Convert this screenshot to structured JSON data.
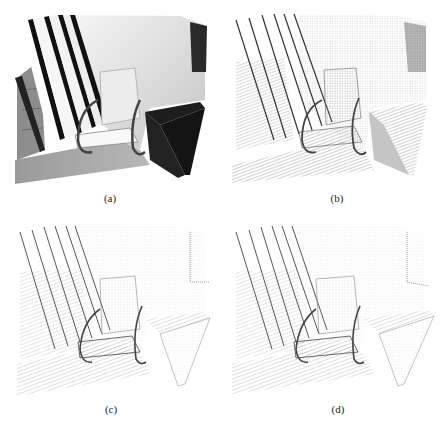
{
  "figure": {
    "panels": [
      {
        "id": "a",
        "caption": "(a)",
        "style": "solid-render"
      },
      {
        "id": "b",
        "caption": "(b)",
        "style": "dense-point-cloud"
      },
      {
        "id": "c",
        "caption": "(c)",
        "style": "sparse-point-cloud"
      },
      {
        "id": "d",
        "caption": "(d)",
        "style": "sparse-point-cloud"
      }
    ],
    "scene": "Indoor point-cloud reconstruction of a room corner with window blinds, a chair, walls and floor",
    "colors": {
      "background": "#ffffff",
      "dark": "#1a1a1a",
      "mid": "#8a8a8a",
      "light": "#e6e6e6"
    }
  }
}
